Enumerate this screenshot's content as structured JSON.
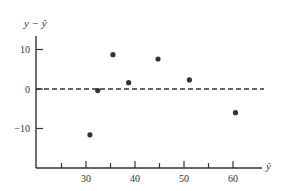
{
  "chart_data": {
    "type": "scatter",
    "title": "",
    "xlabel": "ŷ",
    "ylabel": "y − ŷ",
    "x": [
      30.8,
      32.4,
      35.5,
      38.7,
      44.7,
      51.1,
      60.5
    ],
    "y": [
      -11.6,
      -0.4,
      8.7,
      1.6,
      7.6,
      2.3,
      -6.0
    ],
    "xlim": [
      22,
      65
    ],
    "ylim": [
      -20,
      15
    ],
    "x_ticks": [
      25,
      30,
      35,
      40,
      45,
      50,
      55,
      60
    ],
    "x_tick_labels": [
      "30",
      "40",
      "50",
      "60"
    ],
    "x_tick_labels_at": [
      30,
      40,
      50,
      60
    ],
    "y_ticks": [
      10,
      0,
      -10
    ],
    "y_tick_labels": [
      "10",
      "0",
      "−10"
    ],
    "reference_line": {
      "y": 0,
      "style": "dashed"
    },
    "grid": false,
    "legend": null,
    "colors": {
      "axis": "#333333",
      "point": "#333333",
      "reference": "#333333"
    }
  }
}
